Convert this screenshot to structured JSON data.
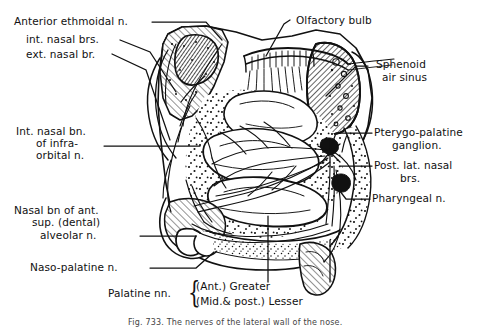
{
  "figure": {
    "caption": "Fig. 733. The nerves of the lateral wall of the nose.",
    "ink_color": "#111111",
    "background": "#ffffff"
  },
  "labels_left": [
    {
      "id": "anterior-ethmoidal-n",
      "text": "Anterior ethmoidal n."
    },
    {
      "id": "int-nasal-brs",
      "text": "int. nasal brs."
    },
    {
      "id": "ext-nasal-br",
      "text": "ext. nasal br."
    },
    {
      "id": "int-nasal-bn-infraorbital-1",
      "text": "Int. nasal bn."
    },
    {
      "id": "int-nasal-bn-infraorbital-2",
      "text": "of infra-"
    },
    {
      "id": "int-nasal-bn-infraorbital-3",
      "text": "orbital n."
    },
    {
      "id": "nasal-bn-ant-sup-alveolar-1",
      "text": "Nasal bn of ant."
    },
    {
      "id": "nasal-bn-ant-sup-alveolar-2",
      "text": "sup. (dental)"
    },
    {
      "id": "nasal-bn-ant-sup-alveolar-3",
      "text": "alveolar n."
    },
    {
      "id": "naso-palatine-n",
      "text": "Naso-palatine n."
    }
  ],
  "labels_right": [
    {
      "id": "olfactory-bulb",
      "text": "Olfactory bulb"
    },
    {
      "id": "sphenoid-air-sinus-1",
      "text": "Sphenoid"
    },
    {
      "id": "sphenoid-air-sinus-2",
      "text": "air sinus"
    },
    {
      "id": "pterygo-palatine-ganglion-1",
      "text": "Pterygo-palatine"
    },
    {
      "id": "pterygo-palatine-ganglion-2",
      "text": "ganglion."
    },
    {
      "id": "post-lat-nasal-brs-1",
      "text": "Post. lat. nasal"
    },
    {
      "id": "post-lat-nasal-brs-2",
      "text": "brs."
    },
    {
      "id": "pharyngeal-n",
      "text": "Pharyngeal n."
    }
  ],
  "labels_bottom": {
    "palatine_nn": "Palatine nn.",
    "brace": "{",
    "greater": "(Ant.) Greater",
    "lesser": "(Mid.& post.) Lesser"
  }
}
